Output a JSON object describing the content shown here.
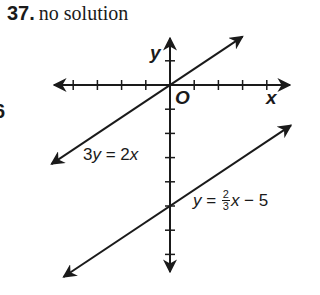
{
  "header": {
    "problem_number": "37.",
    "answer": "no solution"
  },
  "edge_fragment": "6",
  "chart_data": {
    "type": "line",
    "xlabel": "x",
    "ylabel": "y",
    "origin_label": "O",
    "grid": false,
    "xlim": [
      -4.5,
      4.5
    ],
    "ylim": [
      -7.5,
      2
    ],
    "x_ticks": [
      -4,
      -3,
      -2,
      -1,
      1,
      2,
      3,
      4
    ],
    "y_ticks": [
      1,
      -1,
      -2,
      -3,
      -4,
      -5,
      -6,
      -7
    ],
    "series": [
      {
        "name": "3y = 2x",
        "equation": "y = (2/3)x",
        "slope": 0.6667,
        "intercept": 0,
        "x_range": [
          -4.9,
          3
        ],
        "points": [
          [
            -4.9,
            -3.2
          ],
          [
            0,
            0
          ],
          [
            3,
            2
          ]
        ]
      },
      {
        "name": "y = 2/3 x - 5",
        "equation": "y = (2/3)x - 5",
        "slope": 0.6667,
        "intercept": -5,
        "x_range": [
          -4.4,
          5
        ],
        "points": [
          [
            -4.4,
            -7.9
          ],
          [
            0,
            -5
          ],
          [
            5,
            -1.7
          ]
        ]
      }
    ],
    "annotations": [
      "3y = 2x",
      "y = 2/3 x − 5"
    ]
  },
  "labels": {
    "y_axis": "y",
    "x_axis": "x",
    "origin": "O",
    "line1": {
      "lhs_coef": "3",
      "lhs_var": "y",
      "eq": " = ",
      "rhs_coef": "2",
      "rhs_var": "x"
    },
    "line2": {
      "lhs_var": "y",
      "eq": " = ",
      "num": "2",
      "den": "3",
      "var": "x",
      "rest": " − 5"
    }
  }
}
